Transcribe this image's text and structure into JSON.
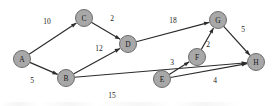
{
  "figure": {
    "width": 276,
    "height": 106,
    "background_color": "#ffffff",
    "node_fill_color": "#a8a8a8",
    "node_stroke_color": "#6d6d6d",
    "edge_color": "#2b2b2b",
    "text_color": "#1a1a1a"
  },
  "chart_data": {
    "type": "diagram",
    "diagram_kind": "directed-weighted-graph",
    "node_radius": 8.5,
    "nodes": [
      {
        "id": "A",
        "label": "A",
        "x": 22,
        "y": 59
      },
      {
        "id": "B",
        "label": "B",
        "x": 66,
        "y": 78
      },
      {
        "id": "C",
        "label": "C",
        "x": 84,
        "y": 18
      },
      {
        "id": "D",
        "label": "D",
        "x": 128,
        "y": 44
      },
      {
        "id": "E",
        "label": "E",
        "x": 162,
        "y": 79
      },
      {
        "id": "F",
        "label": "F",
        "x": 197,
        "y": 57
      },
      {
        "id": "G",
        "label": "G",
        "x": 218,
        "y": 20
      },
      {
        "id": "H",
        "label": "H",
        "x": 256,
        "y": 62
      }
    ],
    "edges": [
      {
        "from": "A",
        "to": "C",
        "weight": 10,
        "label": "10",
        "label_x": 47,
        "label_y": 21
      },
      {
        "from": "A",
        "to": "B",
        "weight": 5,
        "label": "5",
        "label_x": 32,
        "label_y": 80
      },
      {
        "from": "C",
        "to": "D",
        "weight": 2,
        "label": "2",
        "label_x": 112,
        "label_y": 18
      },
      {
        "from": "B",
        "to": "D",
        "weight": 12,
        "label": "12",
        "label_x": 99,
        "label_y": 48
      },
      {
        "from": "B",
        "to": "H",
        "weight": 15,
        "label": "15",
        "label_x": 112,
        "label_y": 95
      },
      {
        "from": "D",
        "to": "G",
        "weight": 18,
        "label": "18",
        "label_x": 173,
        "label_y": 20
      },
      {
        "from": "E",
        "to": "F",
        "weight": 3,
        "label": "3",
        "label_x": 172,
        "label_y": 62
      },
      {
        "from": "E",
        "to": "H",
        "weight": 4,
        "label": "4",
        "label_x": 215,
        "label_y": 80
      },
      {
        "from": "F",
        "to": "G",
        "weight": 2,
        "label": "2",
        "label_x": 208,
        "label_y": 44
      },
      {
        "from": "G",
        "to": "H",
        "weight": 5,
        "label": "5",
        "label_x": 243,
        "label_y": 29
      }
    ]
  }
}
